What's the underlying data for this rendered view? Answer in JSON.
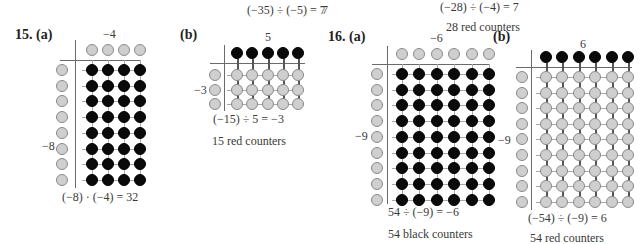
{
  "top_fragments": {
    "eq_prev_a": "(−35) ÷ (−5) = 7",
    "eq_prev_b": "(−28) ÷ (−4) = 7",
    "stray_seven": "7",
    "caption_prev_b": "28 red counters"
  },
  "problems": [
    {
      "number_label": "15. (a)",
      "axis_top": "−4",
      "axis_left": "−8",
      "top_counters": {
        "count": 4,
        "color": "gray"
      },
      "left_counters": {
        "count": 8,
        "color": "gray"
      },
      "grid": {
        "cols": 4,
        "rows": 8,
        "color": "black"
      },
      "equation": "(−8) · (−4) = 32",
      "caption": ""
    },
    {
      "number_label": "(b)",
      "axis_top": "5",
      "axis_left": "−3",
      "top_counters": {
        "count": 5,
        "color": "black"
      },
      "left_counters": {
        "count": 3,
        "color": "gray"
      },
      "grid": {
        "cols": 5,
        "rows": 3,
        "color": "gray"
      },
      "equation": "(−15) ÷ 5 = −3",
      "caption": "15 red counters"
    },
    {
      "number_label": "16. (a)",
      "axis_top": "−6",
      "axis_left": "−9",
      "top_counters": {
        "count": 6,
        "color": "gray"
      },
      "left_counters": {
        "count": 9,
        "color": "gray"
      },
      "grid": {
        "cols": 6,
        "rows": 9,
        "color": "black"
      },
      "equation": "54 ÷ (−9) = −6",
      "caption": "54 black counters"
    },
    {
      "number_label": "(b)",
      "axis_top": "6",
      "axis_left": "−9",
      "top_counters": {
        "count": 6,
        "color": "black"
      },
      "left_counters": {
        "count": 9,
        "color": "gray"
      },
      "grid": {
        "cols": 6,
        "rows": 9,
        "color": "gray"
      },
      "equation": "(−54) ÷ (−9) = 6",
      "caption": "54 red counters"
    }
  ],
  "colors": {
    "black_counter": "#0a0a0a",
    "gray_counter": "#cfcfcf",
    "counter_outline": "#8a8a8a"
  }
}
